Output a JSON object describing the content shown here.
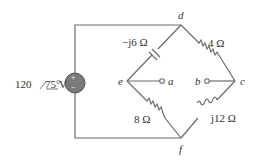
{
  "source": {
    "magnitude": "120",
    "angle": "75°",
    "unit": "V",
    "plus": "+",
    "minus": "−"
  },
  "nodes": {
    "d": "d",
    "e": "e",
    "a": "a",
    "b": "b",
    "c": "c",
    "f": "f"
  },
  "components": {
    "capacitor": "−j6 Ω",
    "r_dc": "4 Ω",
    "r_ef": "8 Ω",
    "inductor": "j12 Ω"
  },
  "colors": {
    "wire": "#6b6b6b",
    "source_fill": "#7a7a7a",
    "text": "#333333"
  }
}
